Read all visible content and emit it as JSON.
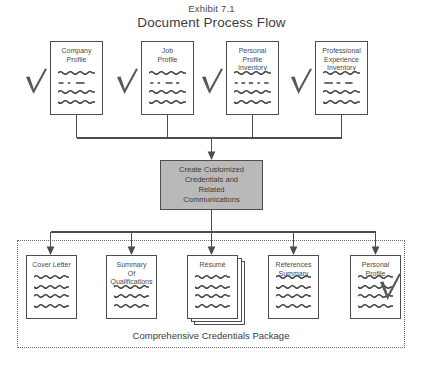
{
  "header": {
    "exhibit_label": "Exhibit 7.1",
    "title": "Document Process Flow"
  },
  "inputs": [
    {
      "label": "Company\nProfile",
      "check": "check-mark-icon"
    },
    {
      "label": "Job\nProfile",
      "check": "check-mark-icon"
    },
    {
      "label": "Personal\nProfile\nInventory",
      "check": "check-mark-icon"
    },
    {
      "label": "Professional\nExperience\nInventory",
      "check": "check-mark-icon"
    }
  ],
  "process": {
    "label": "Create Customized\nCredentials and\nRelated\nCommunications",
    "fill_color": "#b9b9b9"
  },
  "outputs": [
    {
      "label": "Cover Letter",
      "stacked": false,
      "check": null
    },
    {
      "label": "Summary\nOf\nQualifications",
      "stacked": false,
      "check": null
    },
    {
      "label": "Résumé",
      "stacked": true,
      "check": null
    },
    {
      "label": "References\nSummary",
      "stacked": false,
      "check": null
    },
    {
      "label": "Personal Profile",
      "stacked": false,
      "check": "check-mark-icon"
    }
  ],
  "group": {
    "caption": "Comprehensive Credentials Package",
    "border_style": "dotted"
  },
  "colors": {
    "line": "#4d4d4d",
    "text": "#3c3c3c",
    "process_fill": "#b9b9b9",
    "page_background": "#ffffff"
  }
}
